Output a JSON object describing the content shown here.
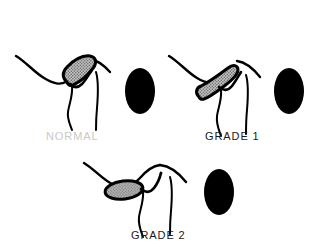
{
  "figure": {
    "background_color": "#ffffff",
    "ink_color": "#000000",
    "lesion_fill_color": "#9a9a9a",
    "normal_label_color": "#c9c9c9",
    "label_color": "#1a1a1a",
    "panels": [
      {
        "id": "normal",
        "label": "NORMAL",
        "label_color": "#c9c9c9",
        "lesion_shape": "intact-wedge",
        "lesion_description": "stippled grey triangular meniscus seated between the curved surfaces",
        "marker": "solid-black-ellipse"
      },
      {
        "id": "grade1",
        "label": "GRADE 1",
        "label_color": "#1a1a1a",
        "lesion_shape": "elongated-oblique",
        "lesion_description": "stippled grey signal elongated and angled down-left, still touching the joint line",
        "marker": "solid-black-ellipse"
      },
      {
        "id": "grade2",
        "label": "GRADE 2",
        "label_color": "#1a1a1a",
        "lesion_shape": "detached-oval",
        "lesion_description": "stippled grey oval fully separated from the joint surface",
        "marker": "solid-black-ellipse"
      }
    ]
  }
}
